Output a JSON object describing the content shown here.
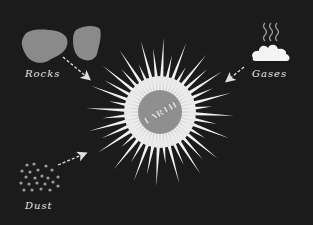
{
  "colors": {
    "background": "#1b1b1b",
    "rock": "#8a8a8a",
    "burst": "#f2f2f2",
    "earth_core": "#8f8f8f",
    "label": "#e6e6e6",
    "arrow": "#e0e0e0"
  },
  "center": {
    "label": "EARTH"
  },
  "sources": [
    {
      "id": "rocks",
      "label": "Rocks",
      "icon": "rocks-icon"
    },
    {
      "id": "gases",
      "label": "Gases",
      "icon": "steam-cloud-icon"
    },
    {
      "id": "dust",
      "label": "Dust",
      "icon": "dust-particles-icon"
    }
  ]
}
